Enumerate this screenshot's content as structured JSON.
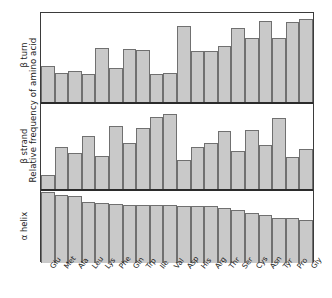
{
  "figure": {
    "ylabel": "Relative frequency of amino acid"
  },
  "chart_data": {
    "type": "bar",
    "title": "",
    "xlabel": "",
    "ylabel": "Relative frequency of amino acid",
    "grid": false,
    "legend": "none",
    "categories": [
      "Glu",
      "Met",
      "Ala",
      "Leu",
      "Lys",
      "Phe",
      "Gln",
      "Trp",
      "Ile",
      "Val",
      "Asp",
      "His",
      "Arg",
      "Thr",
      "Ser",
      "Cys",
      "Asn",
      "Tyr",
      "Pro",
      "Gly"
    ],
    "panels": [
      {
        "name": "beta-turn",
        "label": "β turn",
        "values": [
          0.4,
          0.33,
          0.35,
          0.32,
          0.61,
          0.38,
          0.6,
          0.59,
          0.31,
          0.33,
          0.85,
          0.57,
          0.57,
          0.63,
          0.83,
          0.72,
          0.91,
          0.72,
          0.9,
          0.93
        ],
        "ylim": [
          0,
          1
        ]
      },
      {
        "name": "beta-strand",
        "label": "β strand",
        "values": [
          0.17,
          0.5,
          0.42,
          0.62,
          0.39,
          0.74,
          0.54,
          0.72,
          0.85,
          0.88,
          0.34,
          0.5,
          0.54,
          0.68,
          0.45,
          0.69,
          0.52,
          0.84,
          0.38,
          0.47
        ],
        "ylim": [
          0,
          1
        ]
      },
      {
        "name": "alpha-helix",
        "label": "α helix",
        "values": [
          0.98,
          0.95,
          0.93,
          0.85,
          0.84,
          0.82,
          0.81,
          0.8,
          0.8,
          0.8,
          0.79,
          0.79,
          0.79,
          0.77,
          0.73,
          0.69,
          0.67,
          0.62,
          0.62,
          0.6
        ],
        "ylim": [
          0,
          1
        ]
      }
    ]
  }
}
